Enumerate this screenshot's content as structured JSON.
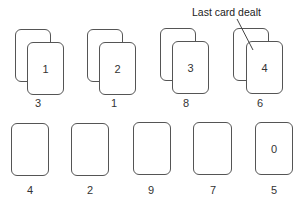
{
  "callout": {
    "text": "Last card dealt"
  },
  "top_row": {
    "stacks": [
      {
        "front_card": "1",
        "count_label": "3"
      },
      {
        "front_card": "2",
        "count_label": "1"
      },
      {
        "front_card": "3",
        "count_label": "8"
      },
      {
        "front_card": "4",
        "count_label": "6"
      }
    ]
  },
  "bottom_row": {
    "cards": [
      {
        "card": "",
        "count_label": "4"
      },
      {
        "card": "",
        "count_label": "2"
      },
      {
        "card": "",
        "count_label": "9"
      },
      {
        "card": "",
        "count_label": "7"
      },
      {
        "card": "0",
        "count_label": "5"
      }
    ]
  },
  "colors": {
    "stroke": "#555555",
    "text": "#333333",
    "background": "#ffffff"
  }
}
